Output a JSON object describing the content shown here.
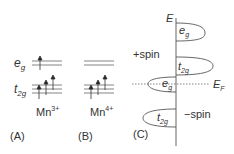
{
  "panel_a": {
    "eg_label": "e",
    "eg_sub": "g",
    "t2g_label": "t",
    "t2g_sub": "2g",
    "ion_base": "Mn",
    "ion_sup": "3+",
    "panel_label": "(A)"
  },
  "panel_b": {
    "ion_base": "Mn",
    "ion_sup": "4+",
    "panel_label": "(B)"
  },
  "panel_c": {
    "axis_label": "E",
    "fermi_label": "E",
    "fermi_sub": "F",
    "plus_spin": "+spin",
    "minus_spin": "−spin",
    "eg_up": "e",
    "eg_up_sub": "g",
    "t2g_up": "t",
    "t2g_up_sub": "2g",
    "eg_down": "e",
    "eg_down_sub": "g",
    "t2g_down": "t",
    "t2g_down_sub": "2g",
    "panel_label": "(C)"
  },
  "colors": {
    "line": "#555555",
    "text": "#333333"
  }
}
